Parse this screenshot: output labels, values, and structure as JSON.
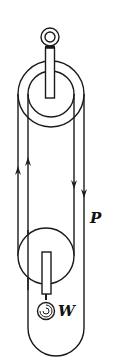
{
  "diagram": {
    "type": "block-and-tackle pulley system",
    "labels": {
      "force": "P",
      "weight": "W"
    },
    "colors": {
      "stroke": "#1a1a1a",
      "background": "#ffffff"
    },
    "parts": [
      "support-ring",
      "upper-pulley",
      "lower-pulley",
      "rope",
      "weight"
    ]
  }
}
